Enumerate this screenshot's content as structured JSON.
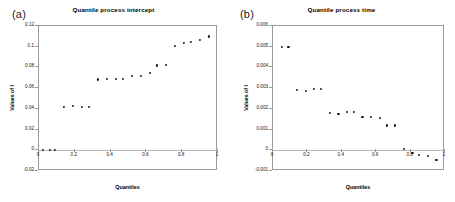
{
  "figure": {
    "background": "#ffffff",
    "marker_color": "#1a1a1a",
    "axis_color": "#9a9a9a"
  },
  "panels": [
    {
      "letter": "(a)",
      "title": "Quantile process intercept",
      "xlabel": "Quantiles",
      "ylabel": "Values of I"
    },
    {
      "letter": "(b)",
      "title": "Quantile process time",
      "xlabel": "Quantiles",
      "ylabel": "Values of I"
    }
  ],
  "chart_data": [
    {
      "type": "scatter",
      "title": "Quantile process intercept",
      "panel_label": "(a)",
      "xlabel": "Quantiles",
      "ylabel": "Values of I",
      "xlim": [
        0,
        1
      ],
      "ylim": [
        -0.02,
        0.12
      ],
      "xticks": [
        0,
        0.2,
        0.4,
        0.6,
        0.8,
        1
      ],
      "xticklabels": [
        "0",
        "0.2",
        "0.4",
        "0.6",
        "0.8",
        "1"
      ],
      "yticks": [
        -0.02,
        0,
        0.02,
        0.04,
        0.06,
        0.08,
        0.1,
        0.12
      ],
      "yticklabels": [
        "-0.02",
        "0",
        "0.02",
        "0.04",
        "0.06",
        "0.08",
        "0.1",
        "0.12"
      ],
      "grid": false,
      "legend": null,
      "x": [
        0.02,
        0.06,
        0.09,
        0.14,
        0.19,
        0.24,
        0.28,
        0.33,
        0.38,
        0.43,
        0.47,
        0.52,
        0.57,
        0.62,
        0.66,
        0.71,
        0.76,
        0.81,
        0.85,
        0.9,
        0.95
      ],
      "y": [
        0.0,
        0.0,
        0.0,
        0.0415,
        0.0425,
        0.0422,
        0.0422,
        0.0685,
        0.0692,
        0.069,
        0.0688,
        0.0715,
        0.0718,
        0.0745,
        0.082,
        0.0822,
        0.101,
        0.1035,
        0.1045,
        0.1065,
        0.11
      ]
    },
    {
      "type": "scatter",
      "title": "Quantile process time",
      "panel_label": "(b)",
      "xlabel": "Quantiles",
      "ylabel": "Values of I",
      "xlim": [
        0,
        1
      ],
      "ylim": [
        -0.001,
        0.006
      ],
      "xticks": [
        0,
        0.2,
        0.4,
        0.6,
        0.8,
        1
      ],
      "xticklabels": [
        "0",
        "0.2",
        "0.4",
        "0.6",
        "0.8",
        "1"
      ],
      "yticks": [
        -0.001,
        0,
        0.001,
        0.002,
        0.003,
        0.004,
        0.005,
        0.006
      ],
      "yticklabels": [
        "-0.001",
        "0",
        "0.001",
        "0.002",
        "0.003",
        "0.004",
        "0.005",
        "0.006"
      ],
      "grid": false,
      "legend": null,
      "x": [
        0.05,
        0.09,
        0.14,
        0.19,
        0.24,
        0.28,
        0.33,
        0.38,
        0.43,
        0.47,
        0.52,
        0.57,
        0.62,
        0.66,
        0.71,
        0.76,
        0.81,
        0.85,
        0.9,
        0.95
      ],
      "y": [
        0.005,
        0.005,
        0.0029,
        0.00285,
        0.00295,
        0.00295,
        0.00182,
        0.00174,
        0.00184,
        0.00185,
        0.00163,
        0.00163,
        0.00156,
        0.0012,
        0.0012,
        5e-05,
        -0.00012,
        -0.00022,
        -0.00028,
        -0.00045
      ]
    }
  ]
}
